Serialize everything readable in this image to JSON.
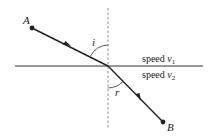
{
  "diagram": {
    "points": {
      "A": {
        "label": "A",
        "x": 32,
        "y": 28
      },
      "B": {
        "label": "B",
        "x": 163,
        "y": 122
      },
      "intersection": {
        "x": 108,
        "y": 66
      }
    },
    "angles": {
      "incident": {
        "label": "i"
      },
      "refracted": {
        "label": "r"
      }
    },
    "regions": {
      "upper": {
        "prefix": "speed ",
        "var": "v",
        "sub": "1"
      },
      "lower": {
        "prefix": "speed ",
        "var": "v",
        "sub": "2"
      }
    },
    "colors": {
      "line": "#222222",
      "normal": "#666666",
      "background": "#ffffff"
    }
  }
}
